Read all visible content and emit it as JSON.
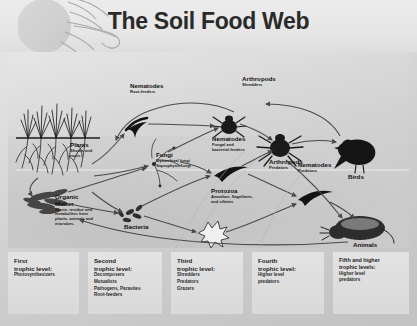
{
  "title": "The Soil Food Web",
  "diagram": {
    "nodes": [
      {
        "name": "plants",
        "label": "Plants",
        "sub": [
          "Shoots and",
          "roots"
        ]
      },
      {
        "name": "organic-matter",
        "label": "Organic",
        "label2": "Matter",
        "sub": [
          "Waste, residue and",
          "metabolites from",
          "plants, animals and",
          "microbes."
        ]
      },
      {
        "name": "bacteria",
        "label": "Bacteria",
        "sub": []
      },
      {
        "name": "fungi",
        "label": "Fungi",
        "sub": [
          "Mycorrhizal fungi",
          "Saprophytic fungi"
        ]
      },
      {
        "name": "nematodes-root-feeders",
        "label": "Nematodes",
        "sub": [
          "Root-feeders"
        ]
      },
      {
        "name": "nematodes-fungal-bacterial",
        "label": "Nematodes",
        "sub": [
          "Fungal and",
          "bacterial-feeders"
        ]
      },
      {
        "name": "nematodes-predators",
        "label": "Nematodes",
        "sub": [
          "Predators"
        ]
      },
      {
        "name": "protozoa",
        "label": "Protozoa",
        "sub": [
          "Amoebae, flagellates,",
          "and ciliates"
        ]
      },
      {
        "name": "arthropods-shredders",
        "label": "Arthropods",
        "sub": [
          "Shredders"
        ]
      },
      {
        "name": "arthropods-predators",
        "label": "Arthropods",
        "sub": [
          "Predators"
        ]
      },
      {
        "name": "birds",
        "label": "Birds",
        "sub": []
      },
      {
        "name": "animals",
        "label": "Animals",
        "sub": []
      }
    ]
  },
  "trophic_levels": [
    {
      "name": "first",
      "heading": "First",
      "heading2": "trophic level:",
      "items": [
        "Photosynthesizers"
      ]
    },
    {
      "name": "second",
      "heading": "Second",
      "heading2": "trophic level:",
      "items": [
        "Decomposers",
        "Mutualists",
        "Pathogens, Parasites",
        "Root-feeders"
      ]
    },
    {
      "name": "third",
      "heading": "Third",
      "heading2": "trophic level:",
      "items": [
        "Shredders",
        "Predators",
        "Grazers"
      ]
    },
    {
      "name": "fourth",
      "heading": "Fourth",
      "heading2": "trophic level:",
      "items": [
        "Higher level",
        "predators"
      ]
    },
    {
      "name": "fifth",
      "heading": "Fifth and higher",
      "heading2": "trophic levels:",
      "items": [
        "Higher level",
        "predators"
      ]
    }
  ],
  "colors": {
    "ink": "#111111",
    "panel_light": "#e8e8e8",
    "panel_dark": "#c2c2c2",
    "box_fill": "#dedede"
  }
}
